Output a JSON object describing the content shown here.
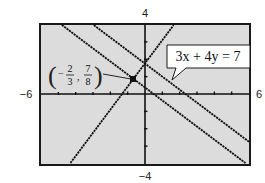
{
  "chart_data": {
    "type": "line",
    "title": "",
    "xlabel": "",
    "ylabel": "",
    "xlim": [
      -6,
      6
    ],
    "ylim": [
      -4,
      4
    ],
    "xscl": 1,
    "yscl": 1,
    "grid": false,
    "window_labels": {
      "ymax": "4",
      "ymin": "-4",
      "xmin": "-6",
      "xmax": "6"
    },
    "series": [
      {
        "name": "3x + 4y = 7",
        "slope": -0.75,
        "intercept": 1.75,
        "labeled": true
      },
      {
        "name": "parallel line through (-2/3, 7/8)",
        "slope": -0.75,
        "intercept": 0.375,
        "labeled": false
      },
      {
        "name": "perpendicular line through (-2/3, 7/8)",
        "slope": 1.3333,
        "intercept": 1.7639,
        "labeled": false
      }
    ],
    "annotations": [
      {
        "text": "3x + 4y = 7",
        "type": "callout",
        "points_to_series": 0
      },
      {
        "text": "(-2/3, 7/8)",
        "type": "point-label",
        "x": -0.6667,
        "y": 0.875
      }
    ],
    "points": [
      {
        "x": -0.6667,
        "y": 0.875,
        "label": "(-2/3, 7/8)"
      }
    ]
  },
  "labels": {
    "ymax": "4",
    "ymin": "−4",
    "xmin": "−6",
    "xmax": "6",
    "equation": "3x + 4y = 7",
    "point": {
      "x_num": "2",
      "x_den": "3",
      "x_sign": "−",
      "y_num": "7",
      "y_den": "8",
      "comma": ","
    }
  },
  "colors": {
    "screen_bg": "#dcdcdc",
    "frame": "#1a1a1a",
    "line": "#111111",
    "callout_bg": "#ffffff"
  }
}
